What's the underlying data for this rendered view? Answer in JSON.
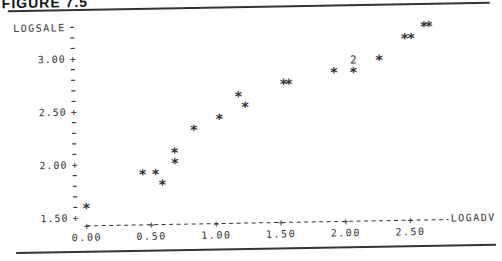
{
  "figure": {
    "title": "FIGURE 7.5"
  },
  "chart_data": {
    "type": "scatter",
    "title": "",
    "xlabel": "LOGADV",
    "ylabel": "LOGSALE",
    "xlim": [
      0.0,
      2.8
    ],
    "ylim": [
      1.45,
      3.3
    ],
    "grid": false,
    "legend": null,
    "x_ticks": [
      "0.00",
      "0.50",
      "1.00",
      "1.50",
      "2.00",
      "2.50"
    ],
    "y_ticks": [
      "1.50",
      "2.00",
      "2.50",
      "3.00"
    ],
    "marker": "*",
    "points": [
      {
        "x": 0.0,
        "y": 1.61
      },
      {
        "x": 0.44,
        "y": 1.92
      },
      {
        "x": 0.54,
        "y": 1.92
      },
      {
        "x": 0.59,
        "y": 1.82
      },
      {
        "x": 0.69,
        "y": 2.12
      },
      {
        "x": 0.69,
        "y": 2.02
      },
      {
        "x": 0.84,
        "y": 2.33
      },
      {
        "x": 1.04,
        "y": 2.43
      },
      {
        "x": 1.19,
        "y": 2.64
      },
      {
        "x": 1.24,
        "y": 2.54
      },
      {
        "x": 1.54,
        "y": 2.75
      },
      {
        "x": 1.58,
        "y": 2.75
      },
      {
        "x": 1.93,
        "y": 2.85
      },
      {
        "x": 2.08,
        "y": 2.85
      },
      {
        "x": 2.08,
        "y": 2.95,
        "count": 2
      },
      {
        "x": 2.28,
        "y": 2.96
      },
      {
        "x": 2.48,
        "y": 3.16
      },
      {
        "x": 2.53,
        "y": 3.16
      },
      {
        "x": 2.63,
        "y": 3.27
      },
      {
        "x": 2.67,
        "y": 3.27
      }
    ],
    "annotations": [
      {
        "text": "2",
        "meaning": "two coincident observations",
        "x": 2.08,
        "y": 2.95
      }
    ]
  },
  "axis_labels": {
    "y": "LOGSALE",
    "x": "LOGADV"
  }
}
